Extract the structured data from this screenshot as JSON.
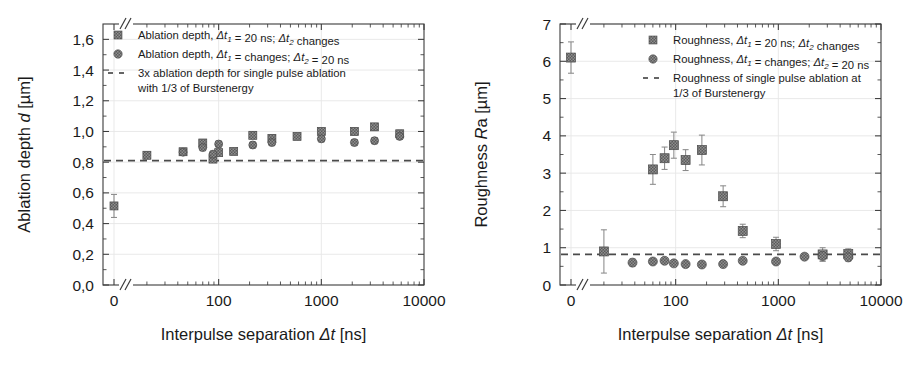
{
  "figure": {
    "background": "#ffffff",
    "marker_color": "#5b5b5b",
    "marker_edge": "#3a3a3a",
    "refline_color": "#4a4a4a",
    "errorbar_color": "#8a8a8a",
    "axis_color": "#3b3b3b",
    "grid_color": "#e6e6e6"
  },
  "chart_data": [
    {
      "id": "ablation-depth",
      "type": "scatter",
      "title": "",
      "xlabel": "Interpulse separation Δt [ns]",
      "ylabel": "Ablation depth d [µm]",
      "xscale": "log",
      "x_axis_break": true,
      "x_break_note": "zero point plotted left of break, then log scale from 10 to 10000",
      "xtick_labels": [
        "0",
        "100",
        "1000",
        "10000"
      ],
      "xtick_values": [
        0,
        100,
        1000,
        10000
      ],
      "xlim": [
        10,
        10000
      ],
      "ylim": [
        0.0,
        1.7
      ],
      "ytick_labels": [
        "0,0",
        "0,2",
        "0,4",
        "0,6",
        "0,8",
        "1,0",
        "1,2",
        "1,4",
        "1,6"
      ],
      "ytick_values": [
        0.0,
        0.2,
        0.4,
        0.6,
        0.8,
        1.0,
        1.2,
        1.4,
        1.6
      ],
      "grid": "horizontal-light",
      "legend_position": "top-left",
      "reference_line": {
        "value": 0.81,
        "style": "dashed",
        "label": "3x ablation depth for single pulse ablation with 1/3 of Burstenergy"
      },
      "legend": [
        {
          "marker": "square",
          "label_parts": [
            "Ablation depth, ",
            "Δt",
            "1",
            " = 20 ns; ",
            "Δt",
            "2",
            " changes"
          ],
          "label": "Ablation depth, Δt1 = 20 ns; Δt2 changes"
        },
        {
          "marker": "circle",
          "label_parts": [
            "Ablation depth,  ",
            "Δt",
            "1",
            " = changes;  ",
            "Δt",
            "2",
            " = 20 ns"
          ],
          "label": "Ablation depth, Δt1 = changes; Δt2 = 20 ns"
        },
        {
          "marker": "dashed-line",
          "label": "3x ablation depth for single pulse ablation",
          "label_line2": "with 1/3 of Burstenergy"
        }
      ],
      "series": [
        {
          "name": "Ablation depth, Δt1 = 20 ns; Δt2 changes",
          "marker": "square",
          "points": [
            {
              "x": 0,
              "y": 0.515,
              "yerr": 0.075,
              "at_zero": true
            },
            {
              "x": 20,
              "y": 0.845,
              "yerr": 0.022
            },
            {
              "x": 45,
              "y": 0.868,
              "yerr": 0.02
            },
            {
              "x": 70,
              "y": 0.925,
              "yerr": 0.022
            },
            {
              "x": 88,
              "y": 0.82,
              "yerr": 0.02
            },
            {
              "x": 100,
              "y": 0.862,
              "yerr": 0.02
            },
            {
              "x": 140,
              "y": 0.87,
              "yerr": 0.02
            },
            {
              "x": 215,
              "y": 0.975,
              "yerr": 0.022
            },
            {
              "x": 330,
              "y": 0.955,
              "yerr": 0.022
            },
            {
              "x": 580,
              "y": 0.968,
              "yerr": 0.02
            },
            {
              "x": 1000,
              "y": 1.0,
              "yerr": 0.022
            },
            {
              "x": 2100,
              "y": 1.0,
              "yerr": 0.022
            },
            {
              "x": 3300,
              "y": 1.03,
              "yerr": 0.022
            },
            {
              "x": 5800,
              "y": 0.985,
              "yerr": 0.022
            }
          ]
        },
        {
          "name": "Ablation depth, Δt1 = changes; Δt2 = 20 ns",
          "marker": "circle",
          "points": [
            {
              "x": 45,
              "y": 0.865,
              "yerr": 0.02
            },
            {
              "x": 70,
              "y": 0.895,
              "yerr": 0.02
            },
            {
              "x": 88,
              "y": 0.852,
              "yerr": 0.02
            },
            {
              "x": 100,
              "y": 0.918,
              "yerr": 0.02
            },
            {
              "x": 215,
              "y": 0.912,
              "yerr": 0.02
            },
            {
              "x": 330,
              "y": 0.928,
              "yerr": 0.02
            },
            {
              "x": 1000,
              "y": 0.952,
              "yerr": 0.02
            },
            {
              "x": 2100,
              "y": 0.928,
              "yerr": 0.02
            },
            {
              "x": 3300,
              "y": 0.94,
              "yerr": 0.02
            },
            {
              "x": 5800,
              "y": 0.968,
              "yerr": 0.02
            }
          ]
        }
      ]
    },
    {
      "id": "roughness",
      "type": "scatter",
      "title": "",
      "xlabel": "Interpulse separation Δt [ns]",
      "ylabel": "Roughness Ra [µm]",
      "xscale": "log",
      "x_axis_break": true,
      "x_break_note": "zero point plotted left of break, then log scale from 10 to 10000",
      "xtick_labels": [
        "0",
        "100",
        "1000",
        "10000"
      ],
      "xtick_values": [
        0,
        100,
        1000,
        10000
      ],
      "xlim": [
        10,
        10000
      ],
      "ylim": [
        0,
        7
      ],
      "ytick_labels": [
        "0",
        "1",
        "2",
        "3",
        "4",
        "5",
        "6",
        "7"
      ],
      "ytick_values": [
        0,
        1,
        2,
        3,
        4,
        5,
        6,
        7
      ],
      "grid": "horizontal-light",
      "legend_position": "top-center",
      "reference_line": {
        "value": 0.82,
        "style": "dashed",
        "label": "Roughness of single pulse ablation at 1/3 of Burstenergy"
      },
      "legend": [
        {
          "marker": "square",
          "label_parts": [
            "Roughness, ",
            "Δt",
            "1",
            " = 20 ns; ",
            "Δt",
            "2",
            " changes"
          ],
          "label": "Roughness, Δt1 = 20 ns; Δt2 changes"
        },
        {
          "marker": "circle",
          "label_parts": [
            "Roughness, ",
            "Δt",
            "1",
            " = changes;  ",
            "Δt",
            "2",
            " = 20 ns"
          ],
          "label": "Roughness, Δt1 = changes; Δt2 = 20 ns"
        },
        {
          "marker": "dashed-line",
          "label": "Roughness of single pulse ablation at",
          "label_line2": "1/3 of Burstenergy"
        }
      ],
      "series": [
        {
          "name": "Roughness, Δt1 = 20 ns; Δt2 changes",
          "marker": "square",
          "points": [
            {
              "x": 0,
              "y": 6.1,
              "yerr": 0.42,
              "at_zero": true
            },
            {
              "x": 20,
              "y": 0.9,
              "yerr": 0.58
            },
            {
              "x": 60,
              "y": 3.1,
              "yerr": 0.4
            },
            {
              "x": 78,
              "y": 3.4,
              "yerr": 0.3
            },
            {
              "x": 96,
              "y": 3.75,
              "yerr": 0.35
            },
            {
              "x": 125,
              "y": 3.35,
              "yerr": 0.28
            },
            {
              "x": 180,
              "y": 3.62,
              "yerr": 0.4
            },
            {
              "x": 290,
              "y": 2.38,
              "yerr": 0.28
            },
            {
              "x": 450,
              "y": 1.45,
              "yerr": 0.18
            },
            {
              "x": 950,
              "y": 1.1,
              "yerr": 0.18
            },
            {
              "x": 2700,
              "y": 0.82,
              "yerr": 0.18
            },
            {
              "x": 4800,
              "y": 0.83,
              "yerr": 0.14
            }
          ]
        },
        {
          "name": "Roughness, Δt1 = changes; Δt2 = 20 ns",
          "marker": "circle",
          "points": [
            {
              "x": 38,
              "y": 0.6,
              "yerr": 0.1
            },
            {
              "x": 60,
              "y": 0.63,
              "yerr": 0.07
            },
            {
              "x": 78,
              "y": 0.65,
              "yerr": 0.07
            },
            {
              "x": 96,
              "y": 0.58,
              "yerr": 0.07
            },
            {
              "x": 125,
              "y": 0.56,
              "yerr": 0.07
            },
            {
              "x": 180,
              "y": 0.55,
              "yerr": 0.07
            },
            {
              "x": 290,
              "y": 0.56,
              "yerr": 0.07
            },
            {
              "x": 450,
              "y": 0.65,
              "yerr": 0.07
            },
            {
              "x": 950,
              "y": 0.63,
              "yerr": 0.07
            },
            {
              "x": 1800,
              "y": 0.76,
              "yerr": 0.08
            },
            {
              "x": 2700,
              "y": 0.78,
              "yerr": 0.14
            },
            {
              "x": 4800,
              "y": 0.74,
              "yerr": 0.1
            }
          ]
        }
      ]
    }
  ]
}
